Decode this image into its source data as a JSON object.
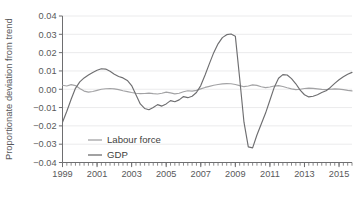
{
  "chart_data": {
    "type": "line",
    "title": "",
    "xlabel": "",
    "ylabel": "Proportionate deviation from trend",
    "xlim": [
      1999.0,
      2015.75
    ],
    "ylim": [
      -0.04,
      0.04
    ],
    "grid": true,
    "legend_position": "inside-bottom-left",
    "ytick_labels": [
      "0.04",
      "0.03",
      "0.02",
      "0.01",
      "0.00",
      "−0.01",
      "−0.02",
      "−0.03",
      "−0.04"
    ],
    "ytick_values": [
      0.04,
      0.03,
      0.02,
      0.01,
      0.0,
      -0.01,
      -0.02,
      -0.03,
      -0.04
    ],
    "xtick_labels": [
      "1999",
      "2001",
      "2003",
      "2005",
      "2007",
      "2009",
      "2011",
      "2013",
      "2015"
    ],
    "xtick_values": [
      1999,
      2001,
      2003,
      2005,
      2007,
      2009,
      2011,
      2013,
      2015
    ],
    "minor_xtick_interval": 0.25,
    "x": [
      1999.0,
      1999.25,
      1999.5,
      1999.75,
      2000.0,
      2000.25,
      2000.5,
      2000.75,
      2001.0,
      2001.25,
      2001.5,
      2001.75,
      2002.0,
      2002.25,
      2002.5,
      2002.75,
      2003.0,
      2003.25,
      2003.5,
      2003.75,
      2004.0,
      2004.25,
      2004.5,
      2004.75,
      2005.0,
      2005.25,
      2005.5,
      2005.75,
      2006.0,
      2006.25,
      2006.5,
      2006.75,
      2007.0,
      2007.25,
      2007.5,
      2007.75,
      2008.0,
      2008.25,
      2008.5,
      2008.75,
      2009.0,
      2009.25,
      2009.5,
      2009.75,
      2010.0,
      2010.25,
      2010.5,
      2010.75,
      2011.0,
      2011.25,
      2011.5,
      2011.75,
      2012.0,
      2012.25,
      2012.5,
      2012.75,
      2013.0,
      2013.25,
      2013.5,
      2013.75,
      2014.0,
      2014.25,
      2014.5,
      2014.75,
      2015.0,
      2015.25,
      2015.5,
      2015.75
    ],
    "series": [
      {
        "name": "Labour force",
        "color": "#a3a3a5",
        "values": [
          0.0022,
          0.0018,
          0.0025,
          0.002,
          0.0004,
          -0.001,
          -0.0016,
          -0.0012,
          -0.0006,
          0.0,
          0.0003,
          0.0004,
          0.0002,
          -0.0002,
          -0.0008,
          -0.0013,
          -0.0018,
          -0.0022,
          -0.0024,
          -0.0023,
          -0.0021,
          -0.0024,
          -0.0026,
          -0.0022,
          -0.0016,
          -0.002,
          -0.0025,
          -0.0022,
          -0.0014,
          -0.0008,
          -0.001,
          -0.0006,
          0.0002,
          0.001,
          0.0016,
          0.0022,
          0.0026,
          0.0029,
          0.0031,
          0.003,
          0.0026,
          0.002,
          0.0014,
          0.0018,
          0.0024,
          0.0021,
          0.0014,
          0.0009,
          0.0012,
          0.0018,
          0.002,
          0.0015,
          0.0008,
          0.0002,
          -0.0002,
          0.0,
          0.0004,
          0.0006,
          0.0005,
          0.0002,
          -0.0001,
          -0.0002,
          0.0,
          0.0002,
          0.0001,
          -0.0002,
          -0.0006,
          -0.0009
        ]
      },
      {
        "name": "GDP",
        "color": "#6e6e70",
        "values": [
          -0.018,
          -0.012,
          -0.0055,
          0.0005,
          0.004,
          0.0062,
          0.0078,
          0.0092,
          0.0104,
          0.0112,
          0.011,
          0.0098,
          0.0082,
          0.007,
          0.0062,
          0.0048,
          0.002,
          -0.003,
          -0.008,
          -0.0105,
          -0.0112,
          -0.01,
          -0.0084,
          -0.0092,
          -0.008,
          -0.0062,
          -0.0068,
          -0.0058,
          -0.004,
          -0.0046,
          -0.0038,
          -0.0018,
          0.002,
          0.0078,
          0.014,
          0.02,
          0.0248,
          0.0282,
          0.0298,
          0.0302,
          0.029,
          0.006,
          -0.018,
          -0.0315,
          -0.032,
          -0.025,
          -0.019,
          -0.013,
          -0.006,
          0.001,
          0.006,
          0.008,
          0.0078,
          0.0058,
          0.003,
          -0.0005,
          -0.003,
          -0.0042,
          -0.0038,
          -0.003,
          -0.0018,
          -0.0008,
          0.001,
          0.0032,
          0.0052,
          0.0068,
          0.0082,
          0.0092
        ]
      }
    ]
  },
  "legend": {
    "items": [
      {
        "label": "Labour force",
        "color": "#a3a3a5"
      },
      {
        "label": "GDP",
        "color": "#6e6e70"
      }
    ]
  },
  "axis": {
    "y_title": "Proportionate deviation from trend"
  }
}
